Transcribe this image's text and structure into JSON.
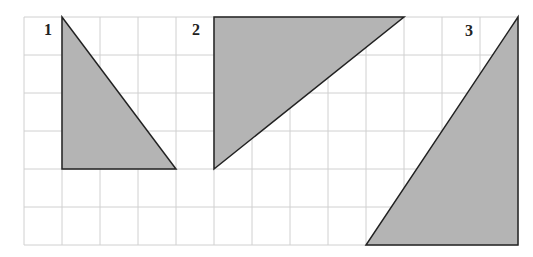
{
  "diagram": {
    "grid": {
      "x0": 24,
      "y0": 17,
      "cell": 38,
      "cols": 13,
      "rows": 6,
      "color": "#d0d0d0"
    },
    "fill_color": "#b4b4b4",
    "stroke_color": "#222222",
    "shapes": [
      {
        "label": "1",
        "label_pos": [
          44,
          35
        ],
        "vertices_grid": [
          [
            1,
            0
          ],
          [
            1,
            4
          ],
          [
            4,
            4
          ]
        ],
        "description": "right triangle, base 3 units, height 4 units"
      },
      {
        "label": "2",
        "label_pos": [
          192,
          35
        ],
        "vertices_grid": [
          [
            5,
            0
          ],
          [
            10,
            0
          ],
          [
            5,
            4
          ]
        ],
        "description": "right triangle, base 5 units, height 4 units"
      },
      {
        "label": "3",
        "label_pos": [
          465,
          36
        ],
        "vertices_grid": [
          [
            13,
            0
          ],
          [
            9,
            6
          ],
          [
            13,
            6
          ]
        ],
        "description": "right triangle, base 4 units, height 6 units"
      }
    ]
  }
}
